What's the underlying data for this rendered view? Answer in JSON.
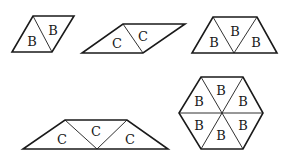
{
  "diagram": {
    "shapes": [
      {
        "id": "rhombus-b",
        "labels": [
          "B",
          "B"
        ]
      },
      {
        "id": "rhombus-c",
        "labels": [
          "C",
          "C"
        ]
      },
      {
        "id": "trapezoid-b",
        "labels": [
          "B",
          "B",
          "B"
        ]
      },
      {
        "id": "trapezoid-c",
        "labels": [
          "C",
          "C",
          "C"
        ]
      },
      {
        "id": "hexagon-b",
        "labels": [
          "B",
          "B",
          "B",
          "B",
          "B",
          "B"
        ]
      }
    ]
  }
}
